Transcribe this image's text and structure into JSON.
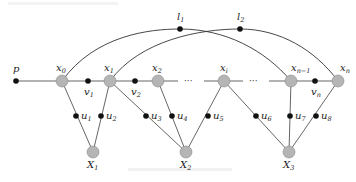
{
  "diagram": {
    "type": "graph",
    "colors": {
      "hub_node": "#b5b5b5",
      "small_node": "#111111",
      "edge": "#555555"
    },
    "nodes": {
      "p": {
        "label": "p",
        "sub": ""
      },
      "x0": {
        "label": "x",
        "sub": "0"
      },
      "x1": {
        "label": "x",
        "sub": "1"
      },
      "x2": {
        "label": "x",
        "sub": "2"
      },
      "xi": {
        "label": "x",
        "sub": "i"
      },
      "xn1": {
        "label": "x",
        "sub": "n−1"
      },
      "xn": {
        "label": "x",
        "sub": "n"
      },
      "v1": {
        "label": "v",
        "sub": "1"
      },
      "v2": {
        "label": "v",
        "sub": "2"
      },
      "vn": {
        "label": "v",
        "sub": "n"
      },
      "l1": {
        "label": "l",
        "sub": "1"
      },
      "l2": {
        "label": "l",
        "sub": "2"
      },
      "u1": {
        "label": "u",
        "sub": "1"
      },
      "u2": {
        "label": "u",
        "sub": "2"
      },
      "u3": {
        "label": "u",
        "sub": "3"
      },
      "u4": {
        "label": "u",
        "sub": "4"
      },
      "u5": {
        "label": "u",
        "sub": "5"
      },
      "u6": {
        "label": "u",
        "sub": "6"
      },
      "u7": {
        "label": "u",
        "sub": "7"
      },
      "u8": {
        "label": "u",
        "sub": "8"
      },
      "X1": {
        "label": "X",
        "sub": "1"
      },
      "X2": {
        "label": "X",
        "sub": "2"
      },
      "X3": {
        "label": "X",
        "sub": "3"
      }
    },
    "ellipsis": "···",
    "edges": [
      [
        "p",
        "x0"
      ],
      [
        "x0",
        "v1"
      ],
      [
        "v1",
        "x1"
      ],
      [
        "x1",
        "v2"
      ],
      [
        "v2",
        "x2"
      ],
      [
        "x2",
        "…"
      ],
      [
        "…",
        "xi"
      ],
      [
        "xi",
        "…"
      ],
      [
        "…",
        "xn1"
      ],
      [
        "xn1",
        "vn"
      ],
      [
        "vn",
        "xn"
      ],
      [
        "x0",
        "l1"
      ],
      [
        "l1",
        "xn1"
      ],
      [
        "x1",
        "l2"
      ],
      [
        "l2",
        "xn"
      ],
      [
        "x0",
        "u1"
      ],
      [
        "u1",
        "X1"
      ],
      [
        "x1",
        "u2"
      ],
      [
        "u2",
        "X1"
      ],
      [
        "x1",
        "u3"
      ],
      [
        "u3",
        "X2"
      ],
      [
        "x2",
        "u4"
      ],
      [
        "u4",
        "X2"
      ],
      [
        "xi",
        "u5"
      ],
      [
        "u5",
        "X2"
      ],
      [
        "xi",
        "u6"
      ],
      [
        "u6",
        "X3"
      ],
      [
        "xn1",
        "u7"
      ],
      [
        "u7",
        "X3"
      ],
      [
        "xn",
        "u8"
      ],
      [
        "u8",
        "X3"
      ]
    ]
  }
}
